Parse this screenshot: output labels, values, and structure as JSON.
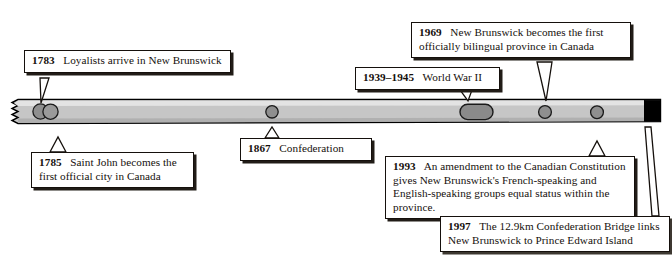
{
  "diagram": {
    "type": "timeline",
    "orientation": "horizontal",
    "colors": {
      "bar_face": "#c9c9c9",
      "bar_top_highlight": "#e0e0e0",
      "bar_outline": "#000000",
      "marker_fill": "#8c8c8c",
      "marker_outline": "#1a1a1a",
      "marker_black": "#000000",
      "box_border": "#15100c",
      "box_shadow": "#211c17",
      "box_fill": "#ffffff",
      "text": "#15100c"
    },
    "bar": {
      "left_edge_style": "torn-zigzag",
      "right_edge_style": "straight"
    }
  },
  "events": [
    {
      "id": "e1783",
      "year": "1783",
      "text": "Loyalists arrive in New Brunswick",
      "marker": "double-circle",
      "callout_side": "above"
    },
    {
      "id": "e1785",
      "year": "1785",
      "text": "Saint John becomes the first official city in Canada",
      "marker": "double-circle",
      "callout_side": "below"
    },
    {
      "id": "e1867",
      "year": "1867",
      "text": "Confederation",
      "marker": "circle",
      "callout_side": "below"
    },
    {
      "id": "ewwii",
      "year": "1939–1945",
      "text": "World War II",
      "marker": "capsule",
      "callout_side": "above"
    },
    {
      "id": "e1969",
      "year": "1969",
      "text": "New Brunswick becomes the first officially  bilingual province in Canada",
      "marker": "circle",
      "callout_side": "above"
    },
    {
      "id": "e1993",
      "year": "1993",
      "text": "An amendment to the Canadian Constitution gives New Brunswick's French-speaking and English-speaking groups equal status within the province.",
      "marker": "circle",
      "callout_side": "below"
    },
    {
      "id": "e1997",
      "year": "1997",
      "text": "The 12.9km Confederation Bridge links New Brunswick to Prince Edward Island",
      "marker": "black-block",
      "callout_side": "below"
    }
  ]
}
